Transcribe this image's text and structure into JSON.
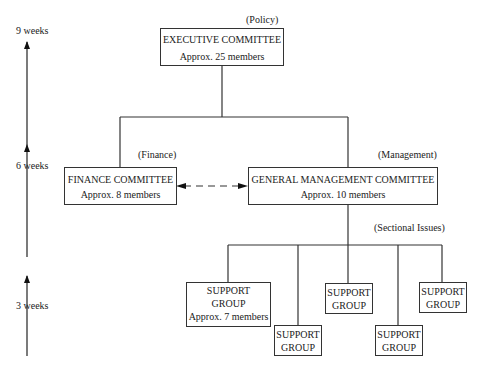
{
  "timeline": {
    "labels": [
      "9 weeks",
      "6 weeks",
      "3 weeks"
    ]
  },
  "executive": {
    "annotation": "(Policy)",
    "title": "EXECUTIVE COMMITTEE",
    "members": "Approx. 25 members"
  },
  "finance": {
    "annotation": "(Finance)",
    "title": "FINANCE COMMITTEE",
    "members": "Approx. 8 members"
  },
  "management": {
    "annotation": "(Management)",
    "title": "GENERAL MANAGEMENT COMMITTEE",
    "members": "Approx. 10 members"
  },
  "support": {
    "annotation": "(Sectional Issues)",
    "groups": [
      {
        "line1": "SUPPORT",
        "line2": "GROUP",
        "members": "Approx. 7 members"
      },
      {
        "line1": "SUPPORT",
        "line2": "GROUP"
      },
      {
        "line1": "SUPPORT",
        "line2": "GROUP"
      },
      {
        "line1": "SUPPORT",
        "line2": "GROUP"
      },
      {
        "line1": "SUPPORT",
        "line2": "GROUP"
      }
    ]
  }
}
